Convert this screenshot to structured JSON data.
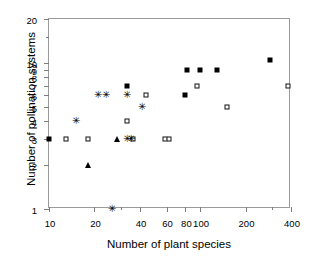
{
  "chart_data": {
    "type": "scatter",
    "title": "",
    "xlabel": "Number of plant species",
    "ylabel": "Number of pollination systems",
    "xscale": "log",
    "yscale": "log",
    "xlim": [
      10,
      400
    ],
    "ylim": [
      1,
      20
    ],
    "grid": false,
    "legend": "none",
    "xticks": [
      {
        "value": 10,
        "label": "10",
        "major": true
      },
      {
        "value": 20,
        "label": "20",
        "major": true
      },
      {
        "value": 30,
        "label": "",
        "major": false
      },
      {
        "value": 40,
        "label": "40",
        "major": true
      },
      {
        "value": 60,
        "label": "60",
        "major": true
      },
      {
        "value": 80,
        "label": "80",
        "major": true
      },
      {
        "value": 100,
        "label": "100",
        "major": true
      },
      {
        "value": 200,
        "label": "200",
        "major": true
      },
      {
        "value": 300,
        "label": "",
        "major": false
      },
      {
        "value": 400,
        "label": "400",
        "major": true
      }
    ],
    "yticks": [
      {
        "value": 1,
        "label": "1",
        "major": true
      },
      {
        "value": 2,
        "label": "2",
        "major": true
      },
      {
        "value": 3,
        "label": "3",
        "major": true
      },
      {
        "value": 4,
        "label": "4",
        "major": true
      },
      {
        "value": 5,
        "label": "5",
        "major": true
      },
      {
        "value": 6,
        "label": "6",
        "major": true
      },
      {
        "value": 7,
        "label": "7",
        "major": true
      },
      {
        "value": 8,
        "label": "8",
        "major": true
      },
      {
        "value": 9,
        "label": "9",
        "major": true
      },
      {
        "value": 10,
        "label": "10",
        "major": true
      },
      {
        "value": 15,
        "label": "",
        "major": false
      },
      {
        "value": 20,
        "label": "20",
        "major": true
      }
    ],
    "series": [
      {
        "name": "filled-square",
        "marker": "filled-square",
        "color": "#000000",
        "points": [
          {
            "x": 10,
            "y": 3
          },
          {
            "x": 33,
            "y": 7
          },
          {
            "x": 80,
            "y": 6
          },
          {
            "x": 82,
            "y": 9
          },
          {
            "x": 100,
            "y": 9
          },
          {
            "x": 130,
            "y": 9
          },
          {
            "x": 290,
            "y": 10.5
          }
        ]
      },
      {
        "name": "open-square",
        "marker": "open-square",
        "color": "#111111",
        "points": [
          {
            "x": 13,
            "y": 3
          },
          {
            "x": 18,
            "y": 3
          },
          {
            "x": 36,
            "y": 3
          },
          {
            "x": 59,
            "y": 3
          },
          {
            "x": 62,
            "y": 3
          },
          {
            "x": 33,
            "y": 4
          },
          {
            "x": 44,
            "y": 6
          },
          {
            "x": 95,
            "y": 7
          },
          {
            "x": 150,
            "y": 5
          },
          {
            "x": 380,
            "y": 7
          }
        ]
      },
      {
        "name": "filled-triangle",
        "marker": "filled-triangle",
        "color": "#000000",
        "points": [
          {
            "x": 18,
            "y": 2
          },
          {
            "x": 28,
            "y": 3
          }
        ]
      },
      {
        "name": "asterisk",
        "marker": "asterisk",
        "glyph": "✳",
        "color": "#000000",
        "points": [
          {
            "x": 15,
            "y": 4
          },
          {
            "x": 21,
            "y": 6
          },
          {
            "x": 24,
            "y": 6
          },
          {
            "x": 33,
            "y": 6
          },
          {
            "x": 41,
            "y": 5
          },
          {
            "x": 33,
            "y": 3
          },
          {
            "x": 35,
            "y": 3
          },
          {
            "x": 26,
            "y": 1
          }
        ]
      }
    ]
  }
}
